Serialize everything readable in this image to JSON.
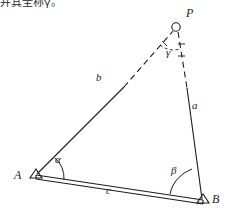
{
  "caption": {
    "text": "并其全称γ。"
  },
  "figure": {
    "background": "#ffffff",
    "stroke_color": "#1c1c1c",
    "vertices": [
      {
        "id": "A",
        "label": "A",
        "x": 36,
        "y": 177,
        "marker": "triangle-station",
        "label_x": 17,
        "label_y": 175
      },
      {
        "id": "B",
        "label": "B",
        "x": 203,
        "y": 202,
        "marker": "triangle-station",
        "label_x": 213,
        "label_y": 198
      },
      {
        "id": "P",
        "label": "P",
        "x": 176,
        "y": 27,
        "marker": "circle-station",
        "label_x": 186,
        "label_y": 12
      }
    ],
    "sides": [
      {
        "id": "a",
        "label": "a",
        "from": "P",
        "to": "B",
        "style": "dashed-then-solid",
        "label_x": 193,
        "label_y": 106
      },
      {
        "id": "b",
        "label": "b",
        "from": "A",
        "to": "P",
        "style": "solid-then-dashed",
        "label_x": 98,
        "label_y": 78
      },
      {
        "id": "c",
        "label": "c",
        "from": "A",
        "to": "B",
        "style": "double-baseline",
        "label_x": 108,
        "label_y": 190
      }
    ],
    "angles": [
      {
        "id": "alpha",
        "label": "α",
        "at": "A",
        "arc": "solid",
        "radius": 26,
        "label_x": 59,
        "label_y": 161
      },
      {
        "id": "beta",
        "label": "β",
        "at": "B",
        "arc": "solid",
        "radius": 33,
        "label_x": 174,
        "label_y": 172
      },
      {
        "id": "gamma",
        "label": "γ",
        "at": "P",
        "arc": "dashed",
        "radius": 22,
        "label_x": 168,
        "label_y": 52
      }
    ]
  }
}
